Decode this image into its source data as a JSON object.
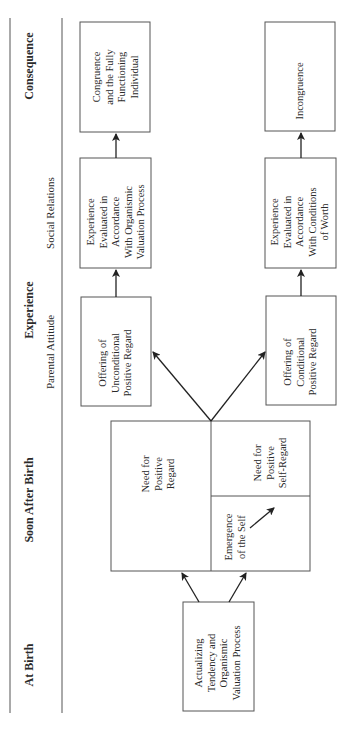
{
  "headers": {
    "at_birth": "At Birth",
    "soon_after_birth": "Soon After Birth",
    "experience": "Experience",
    "consequence": "Consequence"
  },
  "subheaders": {
    "parental_attitude": "Parental Attitude",
    "social_relations": "Social Relations"
  },
  "boxes": {
    "actualizing": [
      "Actualizing",
      "Tendency and",
      "Organismic",
      "Valuation Process"
    ],
    "need_positive_regard": [
      "Need for",
      "Positive",
      "Regard"
    ],
    "need_positive_self_regard": [
      "Need for",
      "Positive",
      "Self-Regard"
    ],
    "emergence_of_self": [
      "Emergence",
      "of the Self"
    ],
    "unconditional": [
      "Offering of",
      "Unconditional",
      "Positive Regard"
    ],
    "conditional": [
      "Offering of",
      "Conditional",
      "Positive Regard"
    ],
    "eval_organismic": [
      "Experience",
      "Evaluated in",
      "Accordance",
      "With Organismic",
      "Valuation Process"
    ],
    "eval_conditions": [
      "Experience",
      "Evaluated in",
      "Accordance",
      "With Conditions",
      "of Worth"
    ],
    "congruence": [
      "Congruence",
      "and the Fully",
      "Functioning",
      "Individual"
    ],
    "incongruence": [
      "Incongruence"
    ]
  }
}
